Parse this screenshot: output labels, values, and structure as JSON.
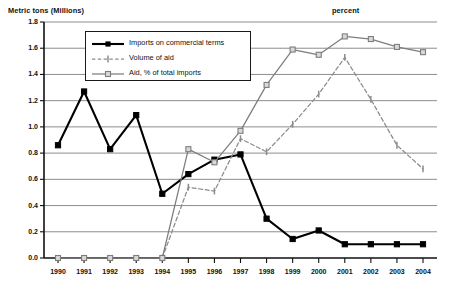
{
  "chart_data": {
    "type": "line",
    "title": "",
    "xlabel": "",
    "ylabel": "Metric tons (Millions)",
    "ylabel_right": "percent",
    "ylim": [
      0.0,
      1.8
    ],
    "ytick_step": 0.2,
    "grid": true,
    "legend_position": "top-left inside plot",
    "categories": [
      "1990",
      "1991",
      "1992",
      "1993",
      "1994",
      "1995",
      "1996",
      "1997",
      "1998",
      "1999",
      "2000",
      "2001",
      "2002",
      "2003",
      "2004"
    ],
    "ytick_labels": [
      "0.0",
      "0.2",
      "0.4",
      "0.6",
      "0.8",
      "1.0",
      "1.2",
      "1.4",
      "1.6",
      "1.8"
    ],
    "series": [
      {
        "name": "Imports on commercial terms",
        "color": "#000000",
        "style": "solid",
        "marker": "filled-square",
        "values": [
          0.86,
          1.27,
          0.83,
          1.09,
          0.49,
          0.64,
          0.75,
          0.79,
          0.3,
          0.145,
          0.21,
          0.105,
          0.105,
          0.105,
          0.105
        ]
      },
      {
        "name": "Volume of aid",
        "color": "#8c8c8c",
        "style": "dashed",
        "marker": "vertical-tick",
        "values": [
          null,
          null,
          null,
          null,
          0.0,
          0.54,
          0.51,
          0.91,
          0.81,
          1.02,
          1.25,
          1.53,
          1.21,
          0.86,
          0.68
        ]
      },
      {
        "name": "Aid, % of total imports",
        "color": "#7d7d7d",
        "style": "solid",
        "marker": "open-square",
        "values": [
          0.0,
          0.0,
          0.0,
          0.0,
          0.0,
          0.83,
          0.73,
          0.97,
          1.32,
          1.59,
          1.55,
          1.69,
          1.67,
          1.61,
          1.57
        ]
      }
    ]
  },
  "legend": {
    "items": [
      {
        "label": "Imports on commercial terms"
      },
      {
        "label": "Volume of aid"
      },
      {
        "label": "Aid, % of total imports"
      }
    ]
  },
  "colors": {
    "axis": "#111111",
    "grid": "#808080",
    "series_black": "#000000",
    "series_gray": "#7d7d7d",
    "series_gray_dashed": "#8c8c8c"
  }
}
